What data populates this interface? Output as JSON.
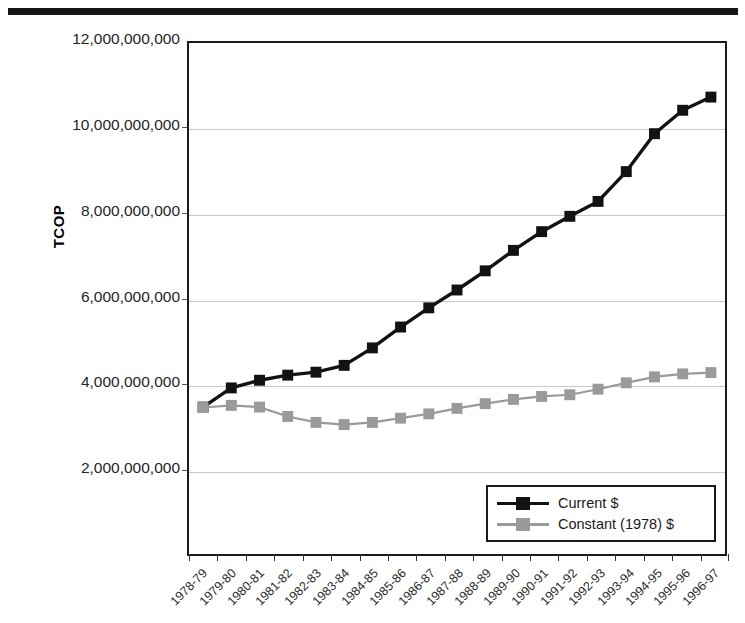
{
  "chart_data": {
    "type": "line",
    "title": "",
    "xlabel": "",
    "ylabel": "TCOP",
    "ylim": [
      0,
      12000000000
    ],
    "ytick_values": [
      12000000000,
      10000000000,
      8000000000,
      6000000000,
      4000000000,
      2000000000
    ],
    "ytick_labels": [
      "12,000,000,000",
      "10,000,000,000",
      "8,000,000,000",
      "6,000,000,000",
      "4,000,000,000",
      "2,000,000,000"
    ],
    "grid": true,
    "legend_position": "lower right",
    "categories": [
      "1978-79",
      "1979-80",
      "1980-81",
      "1981-82",
      "1982-83",
      "1983-84",
      "1984-85",
      "1985-86",
      "1986-87",
      "1987-88",
      "1988-89",
      "1989-90",
      "1990-91",
      "1991-92",
      "1992-93",
      "1993-94",
      "1994-95",
      "1995-96",
      "1996-97"
    ],
    "series": [
      {
        "name": "Current $",
        "color": "#121212",
        "marker": "square",
        "values": [
          3450000000,
          3900000000,
          4080000000,
          4200000000,
          4270000000,
          4430000000,
          4840000000,
          5330000000,
          5780000000,
          6200000000,
          6650000000,
          7130000000,
          7570000000,
          7930000000,
          8280000000,
          8980000000,
          9870000000,
          10420000000,
          10730000000
        ]
      },
      {
        "name": "Constant (1978) $",
        "color": "#9a9a9a",
        "marker": "square",
        "values": [
          3440000000,
          3490000000,
          3450000000,
          3230000000,
          3090000000,
          3040000000,
          3090000000,
          3190000000,
          3290000000,
          3420000000,
          3530000000,
          3630000000,
          3700000000,
          3740000000,
          3870000000,
          4020000000,
          4160000000,
          4230000000,
          4260000000
        ]
      }
    ]
  },
  "legend": {
    "entries": [
      {
        "label": "Current $"
      },
      {
        "label": "Constant (1978) $"
      }
    ]
  }
}
